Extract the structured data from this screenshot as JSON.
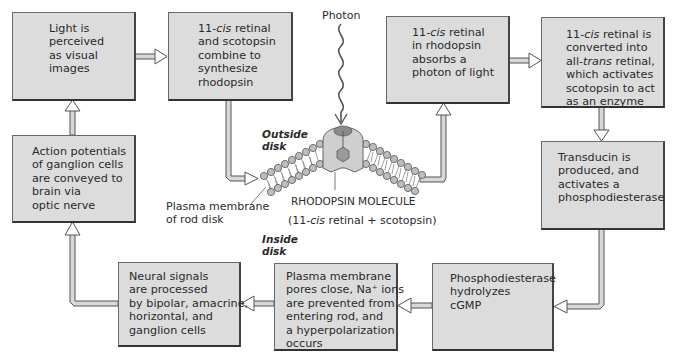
{
  "diagram": {
    "colors": {
      "box_fill": "#dcdcdc",
      "box_border": "#444444",
      "arrow_fill": "#d8d8d8",
      "text": "#2a2a2a"
    },
    "boxes": [
      {
        "id": "light-perceived",
        "lines": [
          "Light is",
          "perceived",
          "as visual",
          "images"
        ]
      },
      {
        "id": "synthesize-rhodopsin",
        "lines": [
          "11-cis retinal",
          "and scotopsin",
          "combine to",
          "synthesize",
          "rhodopsin"
        ]
      },
      {
        "id": "absorbs-photon",
        "lines": [
          "11-cis retinal",
          "in rhodopsin",
          "absorbs a",
          "photon of light"
        ]
      },
      {
        "id": "converted-all-trans",
        "lines": [
          "11-cis retinal is",
          "converted into",
          "all-trans retinal,",
          "which activates",
          "scotopsin to act",
          "as an enzyme"
        ]
      },
      {
        "id": "action-potentials",
        "lines": [
          "Action potentials",
          "of ganglion cells",
          "are conveyed to",
          "brain via",
          "optic nerve"
        ]
      },
      {
        "id": "transducin",
        "lines": [
          "Transducin is",
          "produced, and",
          "activates a",
          "phosphodiesterase"
        ]
      },
      {
        "id": "neural-signals",
        "lines": [
          "Neural signals",
          "are processed",
          "by bipolar, amacrine,",
          "horizontal, and",
          "ganglion cells"
        ]
      },
      {
        "id": "pores-close",
        "lines": [
          "Plasma membrane",
          "pores close, Na⁺ ions",
          "are prevented from",
          "entering rod, and",
          "a hyperpolarization",
          "occurs"
        ]
      },
      {
        "id": "hydrolyzes-cgmp",
        "lines": [
          "Phosphodiesterase",
          "hydrolyzes",
          "cGMP"
        ]
      }
    ],
    "labels": {
      "photon": "Photon",
      "outside_disk_1": "Outside",
      "outside_disk_2": "disk",
      "inside_disk_1": "Inside",
      "inside_disk_2": "disk",
      "plasma_membrane_1": "Plasma membrane",
      "plasma_membrane_2": "of rod disk",
      "rhodopsin_molecule": "RHODOPSIN MOLECULE",
      "rhodopsin_formula": "(11-cis retinal + scotopsin)"
    },
    "flow": [
      "light-perceived -> synthesize-rhodopsin",
      "synthesize-rhodopsin -> membrane",
      "membrane -> absorbs-photon",
      "absorbs-photon -> converted-all-trans",
      "converted-all-trans -> transducin",
      "transducin -> hydrolyzes-cgmp",
      "hydrolyzes-cgmp -> pores-close",
      "pores-close -> neural-signals",
      "neural-signals -> action-potentials",
      "action-potentials -> light-perceived"
    ]
  }
}
